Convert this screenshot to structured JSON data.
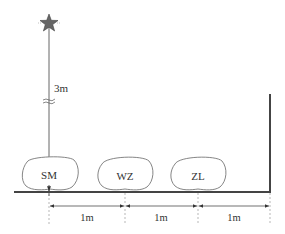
{
  "diagram": {
    "source": {
      "label": "",
      "icon": "star-icon",
      "x": 49,
      "y": 23
    },
    "height_label": "3m",
    "objects": [
      {
        "label": "SM",
        "cx": 49
      },
      {
        "label": "WZ",
        "cx": 125
      },
      {
        "label": "ZL",
        "cx": 198
      }
    ],
    "dimensions": [
      {
        "label": "1m"
      },
      {
        "label": "1m"
      },
      {
        "label": "1m"
      }
    ],
    "colors": {
      "line": "#333333",
      "star": "#555555",
      "wall": "#444444"
    }
  }
}
